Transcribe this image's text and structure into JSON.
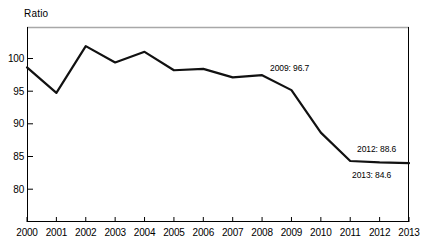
{
  "chart_data": {
    "type": "line",
    "title": "",
    "ylabel": "Ratio",
    "xlabel": "",
    "x": [
      2000,
      2001,
      2002,
      2003,
      2004,
      2005,
      2006,
      2007,
      2008,
      2009,
      2010,
      2011,
      2012,
      2013
    ],
    "categories": [
      "2000",
      "2001",
      "2002",
      "2003",
      "2004",
      "2005",
      "2006",
      "2007",
      "2008",
      "2009",
      "2010",
      "2011",
      "2012",
      "2013"
    ],
    "values": [
      97.8,
      94.2,
      100.8,
      98.5,
      100.0,
      97.4,
      97.6,
      96.4,
      96.7,
      94.6,
      88.6,
      84.6,
      84.4,
      84.3
    ],
    "ylim": [
      76,
      103.5
    ],
    "xlim": [
      2000,
      2013
    ],
    "yticks": [
      100,
      95,
      90,
      85,
      80
    ],
    "ytick_labels": [
      "100",
      "95",
      "90",
      "85",
      "80"
    ],
    "xtick_labels": [
      "2000",
      "2001",
      "2002",
      "2003",
      "2004",
      "2005",
      "2006",
      "2007",
      "2008",
      "2009",
      "2010",
      "2011",
      "2012",
      "2013"
    ],
    "grid": false,
    "legend": "none",
    "line_color": "#111111",
    "annotations": [
      {
        "id": "a2009",
        "text": "2009: 96.7",
        "year": 2009,
        "value": 96.7
      },
      {
        "id": "a2012",
        "text": "2012: 88.6",
        "year": 2012,
        "value": 88.6
      },
      {
        "id": "a2013",
        "text": "2013: 84.6",
        "year": 2013,
        "value": 84.6
      }
    ]
  },
  "axis": {
    "y_title": "Ratio",
    "y_labels": [
      "100",
      "95",
      "90",
      "85",
      "80"
    ],
    "x_labels": [
      "2000",
      "2001",
      "2002",
      "2003",
      "2004",
      "2005",
      "2006",
      "2007",
      "2008",
      "2009",
      "2010",
      "2011",
      "2012",
      "2013"
    ]
  },
  "annotations": {
    "peak_2009": "2009: 96.7",
    "point_2012": "2012: 88.6",
    "point_2013": "2013: 84.6"
  },
  "colors": {
    "line": "#111111",
    "frame": "#000000",
    "frame_top": "#a8a8a8",
    "background": "#ffffff"
  }
}
